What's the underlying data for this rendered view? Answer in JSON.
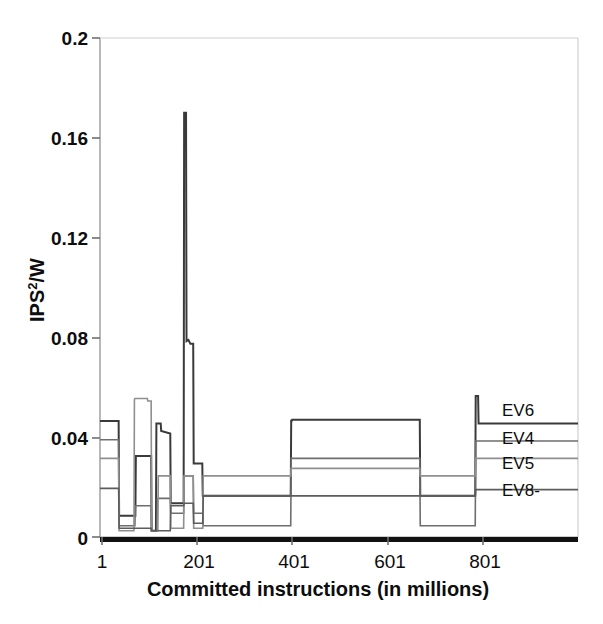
{
  "chart_data": {
    "type": "line",
    "title": "",
    "xlabel": "Committed instructions (in millions)",
    "ylabel": "IPS2/W",
    "ylabel_base": "IPS",
    "ylabel_sup": "2",
    "ylabel_tail": "/W",
    "xlim": [
      1,
      1001
    ],
    "ylim": [
      0,
      0.2
    ],
    "xticks": [
      1,
      201,
      401,
      601,
      801
    ],
    "xtick_labels": [
      "1",
      "201",
      "401",
      "601",
      "801"
    ],
    "yticks": [
      0,
      0.04,
      0.08,
      0.12,
      0.16,
      0.2
    ],
    "ytick_labels": [
      "0",
      "0.04",
      "0.08",
      "0.12",
      "0.16",
      "0.2"
    ],
    "grid": false,
    "legend_position": "right-inline",
    "series": [
      {
        "name": "EV6",
        "label": "EV6",
        "color": "#3a3a3a",
        "width": 2.0,
        "points": [
          [
            1,
            0.0465
          ],
          [
            40,
            0.0465
          ],
          [
            41,
            0.0085
          ],
          [
            75,
            0.0085
          ],
          [
            76,
            0.0325
          ],
          [
            108,
            0.0325
          ],
          [
            109,
            0.0025
          ],
          [
            118,
            0.0025
          ],
          [
            119,
            0.0455
          ],
          [
            128,
            0.0455
          ],
          [
            129,
            0.0425
          ],
          [
            148,
            0.0415
          ],
          [
            149,
            0.0135
          ],
          [
            160,
            0.0135
          ],
          [
            161,
            0.0135
          ],
          [
            176,
            0.0135
          ],
          [
            177,
            0.17
          ],
          [
            181,
            0.17
          ],
          [
            182,
            0.0785
          ],
          [
            186,
            0.079
          ],
          [
            190,
            0.0775
          ],
          [
            196,
            0.0775
          ],
          [
            197,
            0.0295
          ],
          [
            215,
            0.0295
          ],
          [
            216,
            0.0165
          ],
          [
            400,
            0.0165
          ],
          [
            401,
            0.047
          ],
          [
            402,
            0.0465
          ],
          [
            403,
            0.047
          ],
          [
            670,
            0.047
          ],
          [
            671,
            0.0165
          ],
          [
            786,
            0.0165
          ],
          [
            787,
            0.0565
          ],
          [
            792,
            0.0565
          ],
          [
            793,
            0.0455
          ],
          [
            1001,
            0.0455
          ]
        ]
      },
      {
        "name": "EV4",
        "label": "EV4",
        "color": "#6e6e6e",
        "width": 1.6,
        "points": [
          [
            1,
            0.039
          ],
          [
            40,
            0.039
          ],
          [
            41,
            0.0045
          ],
          [
            74,
            0.0045
          ],
          [
            75,
            0.0125
          ],
          [
            108,
            0.0125
          ],
          [
            109,
            0.0025
          ],
          [
            120,
            0.0025
          ],
          [
            121,
            0.0155
          ],
          [
            148,
            0.0155
          ],
          [
            149,
            0.0095
          ],
          [
            176,
            0.0095
          ],
          [
            177,
            0.0245
          ],
          [
            196,
            0.0245
          ],
          [
            197,
            0.0095
          ],
          [
            216,
            0.0095
          ],
          [
            217,
            0.0045
          ],
          [
            400,
            0.0045
          ],
          [
            401,
            0.0315
          ],
          [
            670,
            0.0315
          ],
          [
            671,
            0.0045
          ],
          [
            786,
            0.0045
          ],
          [
            787,
            0.0385
          ],
          [
            1001,
            0.0385
          ]
        ]
      },
      {
        "name": "EV5",
        "label": "EV5",
        "color": "#8f8f8f",
        "width": 1.6,
        "points": [
          [
            1,
            0.0315
          ],
          [
            40,
            0.0315
          ],
          [
            41,
            0.0025
          ],
          [
            72,
            0.0025
          ],
          [
            73,
            0.055
          ],
          [
            74,
            0.0555
          ],
          [
            100,
            0.0555
          ],
          [
            101,
            0.0545
          ],
          [
            108,
            0.0545
          ],
          [
            109,
            0.0025
          ],
          [
            122,
            0.0025
          ],
          [
            123,
            0.0245
          ],
          [
            148,
            0.0245
          ],
          [
            149,
            0.0035
          ],
          [
            176,
            0.0035
          ],
          [
            177,
            0.0245
          ],
          [
            196,
            0.0245
          ],
          [
            197,
            0.0035
          ],
          [
            216,
            0.0035
          ],
          [
            217,
            0.0245
          ],
          [
            400,
            0.0245
          ],
          [
            401,
            0.0275
          ],
          [
            670,
            0.0275
          ],
          [
            671,
            0.0245
          ],
          [
            786,
            0.0245
          ],
          [
            787,
            0.0315
          ],
          [
            1001,
            0.0315
          ]
        ]
      },
      {
        "name": "EV8-",
        "label": "EV8-",
        "color": "#5c5c5c",
        "width": 1.6,
        "points": [
          [
            1,
            0.0195
          ],
          [
            40,
            0.0195
          ],
          [
            41,
            0.0035
          ],
          [
            108,
            0.0035
          ],
          [
            109,
            0.0025
          ],
          [
            148,
            0.0025
          ],
          [
            149,
            0.0125
          ],
          [
            176,
            0.0125
          ],
          [
            177,
            0.0135
          ],
          [
            196,
            0.0135
          ],
          [
            197,
            0.0055
          ],
          [
            216,
            0.0055
          ],
          [
            217,
            0.0165
          ],
          [
            400,
            0.0165
          ],
          [
            401,
            0.0165
          ],
          [
            670,
            0.0165
          ],
          [
            671,
            0.0165
          ],
          [
            786,
            0.0165
          ],
          [
            787,
            0.019
          ],
          [
            1001,
            0.019
          ]
        ]
      }
    ],
    "legend_entries": [
      {
        "label": "EV6",
        "y_value": 0.0455,
        "color": "#3a3a3a"
      },
      {
        "label": "EV4",
        "y_value": 0.0385,
        "color": "#6e6e6e"
      },
      {
        "label": "EV5",
        "y_value": 0.0315,
        "color": "#8f8f8f"
      },
      {
        "label": "EV8-",
        "y_value": 0.019,
        "color": "#5c5c5c"
      }
    ]
  },
  "axes": {
    "y_label_base": "IPS",
    "y_label_sup": "2",
    "y_label_tail": "/W",
    "x_title": "Committed instructions (in millions)",
    "ytick_0": "0",
    "ytick_1": "0.04",
    "ytick_2": "0.08",
    "ytick_3": "0.12",
    "ytick_4": "0.16",
    "ytick_5": "0.2",
    "xtick_0": "1",
    "xtick_1": "201",
    "xtick_2": "401",
    "xtick_3": "601",
    "xtick_4": "801"
  },
  "legend": {
    "ev6": "EV6",
    "ev4": "EV4",
    "ev5": "EV5",
    "ev8": "EV8-"
  },
  "colors": {
    "axis": "#9a9a9a",
    "baseline": "#111111",
    "text": "#0d0d0d",
    "ev6": "#3a3a3a",
    "ev4": "#6e6e6e",
    "ev5": "#8f8f8f",
    "ev8": "#5c5c5c"
  }
}
